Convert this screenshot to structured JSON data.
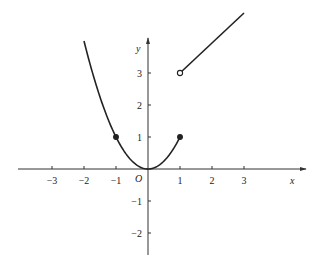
{
  "chart_data": {
    "type": "line",
    "title": "",
    "xlabel": "x",
    "ylabel": "y",
    "origin_label": "O",
    "xlim": [
      -4,
      5
    ],
    "ylim": [
      -2.7,
      4.1
    ],
    "grid": false,
    "legend": null,
    "x_ticks": [
      -3,
      -2,
      -1,
      1,
      2,
      3
    ],
    "x_tick_labels": [
      "−3",
      "−2",
      "−1",
      "1",
      "2",
      "3"
    ],
    "y_ticks": [
      -2,
      -1,
      1,
      2,
      3
    ],
    "y_tick_labels": [
      "−2",
      "−1",
      "1",
      "2",
      "3"
    ],
    "series": [
      {
        "name": "y = x^2 (−2 ≤ x ≤ 1)",
        "kind": "curve",
        "domain": [
          -2,
          1
        ],
        "points": [
          [
            -2,
            4
          ],
          [
            -1.5,
            2.25
          ],
          [
            -1,
            1
          ],
          [
            -0.5,
            0.25
          ],
          [
            0,
            0
          ],
          [
            0.5,
            0.25
          ],
          [
            1,
            1
          ]
        ]
      },
      {
        "name": "y = x + 2 (1 < x ≤ 3)",
        "kind": "segment",
        "domain": [
          1,
          3
        ],
        "points": [
          [
            1,
            3
          ],
          [
            3,
            5
          ]
        ]
      }
    ],
    "markers": [
      {
        "x": -1,
        "y": 1,
        "style": "filled"
      },
      {
        "x": 1,
        "y": 1,
        "style": "filled"
      },
      {
        "x": 1,
        "y": 3,
        "style": "open"
      }
    ],
    "colors": {
      "axis": "#333333",
      "curve": "#222222",
      "background": "#ffffff"
    }
  }
}
